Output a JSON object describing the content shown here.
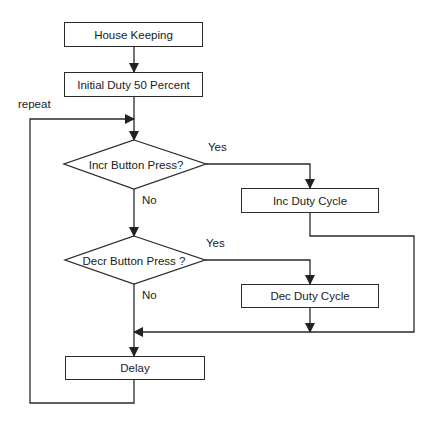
{
  "flowchart": {
    "nodes": {
      "house_keeping": "House Keeping",
      "initial_duty": "Initial Duty 50 Percent",
      "incr_decision": "Incr Button Press?",
      "inc_duty": "Inc Duty Cycle",
      "decr_decision": "Decr Button Press ?",
      "dec_duty": "Dec Duty Cycle",
      "delay": "Delay"
    },
    "labels": {
      "repeat": "repeat",
      "incr_yes": "Yes",
      "incr_no": "No",
      "decr_yes": "Yes",
      "decr_no": "No"
    },
    "colors": {
      "line": "#2a2a2a",
      "background": "#ffffff"
    }
  }
}
